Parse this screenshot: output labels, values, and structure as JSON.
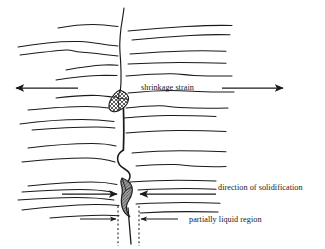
{
  "figure": {
    "type": "schematic-diagram",
    "background_color": "#ffffff",
    "line_color": "#1a1a1a",
    "hatch_color": "#555555",
    "fill_color": "#9a9a9a",
    "width": 325,
    "height": 249
  },
  "labels": {
    "shrinkage_strain": "shrinkage strain",
    "direction_of_solidification": "direction of solidification",
    "partially_liquid_region": "partially liquid region"
  },
  "annotations": [
    {
      "name": "shrinkage-strain",
      "text": "shrinkage strain",
      "x": 141,
      "y": 90,
      "describes": "opposing tensile arrows pulling the solidifying shell apart"
    },
    {
      "name": "direction-of-solidification",
      "text": "direction of solidification",
      "x": 218,
      "y": 190,
      "describes": "inward converging arrows toward the crack centreline"
    },
    {
      "name": "partially-liquid-region",
      "text": "partially liquid region",
      "x": 190,
      "y": 223,
      "describes": "mushy zone bounded by two vertical dotted lines"
    }
  ],
  "arrows": [
    {
      "name": "shrinkage-arrow-left",
      "direction": "left",
      "x1": 78,
      "y1": 88,
      "x2": 14,
      "y2": 88
    },
    {
      "name": "shrinkage-arrow-right",
      "direction": "right",
      "x1": 222,
      "y1": 88,
      "x2": 285,
      "y2": 88
    },
    {
      "name": "solidification-arrow-left",
      "direction": "right",
      "x1": 62,
      "y1": 194,
      "x2": 116,
      "y2": 194
    },
    {
      "name": "solidification-arrow-right",
      "direction": "left",
      "x1": 216,
      "y1": 194,
      "x2": 143,
      "y2": 194
    },
    {
      "name": "mushy-zone-arrow-left",
      "direction": "right",
      "x1": 78,
      "y1": 219,
      "x2": 116,
      "y2": 219
    },
    {
      "name": "mushy-zone-arrow-right",
      "direction": "left",
      "x1": 180,
      "y1": 219,
      "x2": 141,
      "y2": 219
    }
  ],
  "dotted_guides": [
    {
      "name": "mushy-zone-boundary-left",
      "x": 118,
      "y1": 205,
      "y2": 246
    },
    {
      "name": "mushy-zone-boundary-right",
      "x": 139,
      "y1": 205,
      "y2": 246
    }
  ],
  "shaded_regions": [
    {
      "name": "upper-liquid-pocket",
      "pattern": "cross-hatch",
      "cx": 120,
      "cy": 102
    },
    {
      "name": "lower-liquid-film",
      "pattern": "diagonal-hatch",
      "cx": 127,
      "cy": 196
    }
  ],
  "grain_boundaries": {
    "count": 14,
    "style": "wavy horizontal lines",
    "crack_line": "vertical central boundary with two bulges"
  }
}
